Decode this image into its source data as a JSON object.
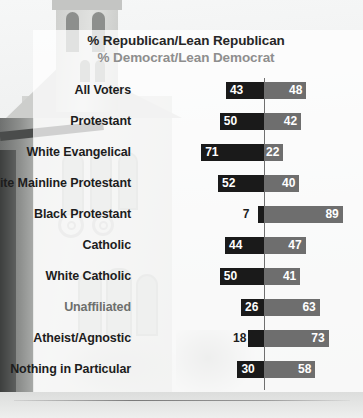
{
  "header": {
    "republican_legend": "% Republican/Lean Republican",
    "democrat_legend": "% Democrat/Lean Democrat"
  },
  "colors": {
    "republican_bar": "#1a1a1a",
    "democrat_bar": "#6e6e6e",
    "republican_label": "#262626",
    "democrat_label": "#8e8e8e",
    "axis_line": "#6f6f6f"
  },
  "chart_data": {
    "type": "bar",
    "title": "",
    "subtitle": "",
    "xlabel": "",
    "ylabel": "",
    "orientation": "horizontal",
    "layout": "diverging",
    "axis_center": 0,
    "grid": false,
    "legend_position": "top",
    "categories": [
      "All Voters",
      "Protestant",
      "White Evangelical",
      "White Mainline Protestant",
      "Black Protestant",
      "Catholic",
      "White Catholic",
      "Unaffiliated",
      "Atheist/Agnostic",
      "Nothing in Particular"
    ],
    "series": [
      {
        "name": "% Republican/Lean Republican",
        "color": "#1a1a1a",
        "values": [
          43,
          50,
          71,
          52,
          7,
          44,
          50,
          26,
          18,
          30
        ]
      },
      {
        "name": "% Democrat/Lean Democrat",
        "color": "#6e6e6e",
        "values": [
          48,
          42,
          22,
          40,
          89,
          47,
          41,
          63,
          73,
          58
        ]
      }
    ]
  },
  "rows": [
    {
      "label": "All Voters",
      "rep": 43,
      "dem": 48,
      "rep_outside": false,
      "faded": false
    },
    {
      "label": "Protestant",
      "rep": 50,
      "dem": 42,
      "rep_outside": false,
      "faded": false
    },
    {
      "label": "White Evangelical",
      "rep": 71,
      "dem": 22,
      "rep_outside": false,
      "faded": false
    },
    {
      "label": "White Mainline Protestant",
      "rep": 52,
      "dem": 40,
      "rep_outside": false,
      "faded": false
    },
    {
      "label": "Black Protestant",
      "rep": 7,
      "dem": 89,
      "rep_outside": true,
      "faded": false
    },
    {
      "label": "Catholic",
      "rep": 44,
      "dem": 47,
      "rep_outside": false,
      "faded": false
    },
    {
      "label": "White Catholic",
      "rep": 50,
      "dem": 41,
      "rep_outside": false,
      "faded": false
    },
    {
      "label": "Unaffiliated",
      "rep": 26,
      "dem": 63,
      "rep_outside": false,
      "faded": true
    },
    {
      "label": "Atheist/Agnostic",
      "rep": 18,
      "dem": 73,
      "rep_outside": true,
      "faded": false
    },
    {
      "label": "Nothing in Particular",
      "rep": 30,
      "dem": 58,
      "rep_outside": false,
      "faded": false
    }
  ],
  "footer": {
    "cut_off_text": ""
  }
}
